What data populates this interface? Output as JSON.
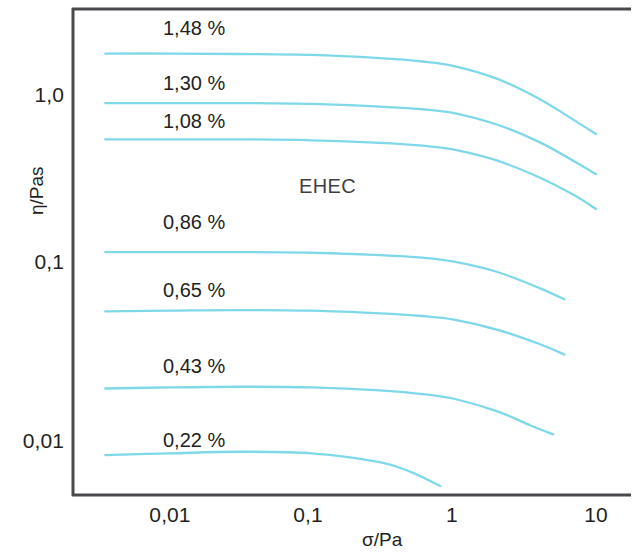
{
  "chart_data": {
    "type": "line",
    "title": "",
    "annotation": "EHEC",
    "xlabel": "σ/Pa",
    "ylabel": "η/Pas",
    "xscale": "log",
    "yscale": "log",
    "xlim": [
      0.0035,
      20
    ],
    "ylim": [
      0.0055,
      2.6
    ],
    "grid": false,
    "legend": "inline-labels",
    "xticks": [
      "0,01",
      "0,1",
      "1",
      "10"
    ],
    "xtick_values": [
      0.01,
      0.1,
      1,
      10
    ],
    "yticks": [
      "1,0",
      "0,1",
      "0,01"
    ],
    "ytick_values": [
      1.0,
      0.1,
      0.01
    ],
    "series_color": "#7fd8e8",
    "series": [
      {
        "name": "1,48 %",
        "label": "1,48 %",
        "x": [
          0.0035,
          0.01,
          0.03,
          0.1,
          0.3,
          0.6,
          1.0,
          2.0,
          4.0,
          7.0,
          10.0
        ],
        "y": [
          1.72,
          1.72,
          1.71,
          1.69,
          1.62,
          1.55,
          1.46,
          1.24,
          0.95,
          0.72,
          0.6
        ]
      },
      {
        "name": "1,30 %",
        "label": "1,30 %",
        "x": [
          0.0035,
          0.01,
          0.03,
          0.1,
          0.3,
          0.6,
          1.0,
          2.0,
          4.0,
          7.0,
          10.0
        ],
        "y": [
          0.9,
          0.9,
          0.9,
          0.89,
          0.86,
          0.83,
          0.79,
          0.68,
          0.54,
          0.42,
          0.355
        ]
      },
      {
        "name": "1,08 %",
        "label": "1,08 %",
        "x": [
          0.0035,
          0.01,
          0.03,
          0.1,
          0.3,
          0.6,
          1.0,
          2.0,
          4.0,
          7.0,
          10.0
        ],
        "y": [
          0.56,
          0.56,
          0.56,
          0.553,
          0.535,
          0.515,
          0.49,
          0.425,
          0.34,
          0.27,
          0.225
        ]
      },
      {
        "name": "0,86 %",
        "label": "0,86 %",
        "x": [
          0.0035,
          0.01,
          0.03,
          0.1,
          0.3,
          0.6,
          1.0,
          2.0,
          4.0,
          6.0
        ],
        "y": [
          0.128,
          0.128,
          0.128,
          0.127,
          0.123,
          0.119,
          0.113,
          0.099,
          0.08,
          0.069
        ]
      },
      {
        "name": "0,65 %",
        "label": "0,65 %",
        "x": [
          0.0035,
          0.01,
          0.03,
          0.1,
          0.3,
          0.6,
          1.0,
          2.0,
          4.0,
          6.0
        ],
        "y": [
          0.059,
          0.0595,
          0.06,
          0.0595,
          0.0575,
          0.0555,
          0.053,
          0.0465,
          0.0385,
          0.0335
        ]
      },
      {
        "name": "0,43 %",
        "label": "0,43 %",
        "x": [
          0.0035,
          0.01,
          0.03,
          0.1,
          0.3,
          0.6,
          1.0,
          2.0,
          3.5,
          5.0
        ],
        "y": [
          0.0215,
          0.0218,
          0.022,
          0.0218,
          0.021,
          0.02,
          0.0188,
          0.016,
          0.0132,
          0.0118
        ]
      },
      {
        "name": "0,22 %",
        "label": "0,22 %",
        "x": [
          0.0035,
          0.01,
          0.03,
          0.1,
          0.3,
          0.5,
          0.8
        ],
        "y": [
          0.009,
          0.0092,
          0.0094,
          0.0092,
          0.0082,
          0.0072,
          0.006
        ]
      }
    ]
  },
  "axes": {
    "y_title": "η/Pas",
    "x_title": "σ/Pa",
    "y_tick_labels": [
      "1,0",
      "0,1",
      "0,01"
    ],
    "x_tick_labels": [
      "0,01",
      "0,1",
      "1",
      "10"
    ]
  },
  "labels": {
    "annotation": "EHEC",
    "curve_labels": [
      "1,48 %",
      "1,30 %",
      "1,08 %",
      "0,86 %",
      "0,65 %",
      "0,43 %",
      "0,22 %"
    ]
  },
  "colors": {
    "curve": "#7fd8e8",
    "axis": "#4a4a4e",
    "text": "#231f20"
  }
}
